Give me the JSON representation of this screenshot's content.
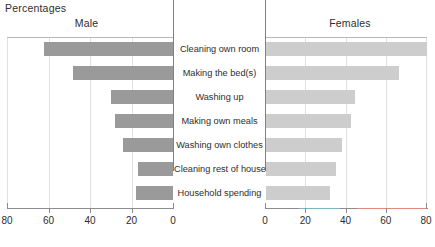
{
  "chart_data": {
    "type": "bar",
    "title": "Percentages",
    "subtitle_left": "Male",
    "subtitle_right": "Females",
    "xlabel": "",
    "ylabel": "",
    "orientation": "horizontal",
    "layout": "back-to-back",
    "grid": true,
    "legend_position": "none",
    "xlim_left": [
      80,
      0
    ],
    "xlim_right": [
      0,
      80
    ],
    "tick_values_left": [
      80,
      60,
      40,
      20,
      0
    ],
    "tick_values_right": [
      0,
      20,
      40,
      60,
      80
    ],
    "tick_labels_left": [
      "80",
      "60",
      "40",
      "20",
      "0"
    ],
    "tick_labels_right": [
      "0",
      "20",
      "40",
      "60",
      "80"
    ],
    "categories": [
      "Cleaning own room",
      "Making the bed(s)",
      "Washing up",
      "Making own meals",
      "Washing own clothes",
      "Cleaning rest of house",
      "Household spending"
    ],
    "series": [
      {
        "name": "Male",
        "color": "#9a9a9a",
        "values": [
          62,
          48,
          30,
          28,
          24,
          17,
          18
        ]
      },
      {
        "name": "Females",
        "color": "#cdcdcd",
        "values": [
          80,
          66,
          44,
          42,
          38,
          35,
          32
        ]
      }
    ]
  },
  "colors": {
    "male_bar": "#9a9a9a",
    "female_bar": "#cdcdcd",
    "gridline": "#e2e2e2",
    "axis": "#8c8c8c",
    "zero_axis": "#808080",
    "text": "#2d2d2d",
    "accent_teal": "#7fb6c4",
    "accent_red": "#e08a7a"
  }
}
